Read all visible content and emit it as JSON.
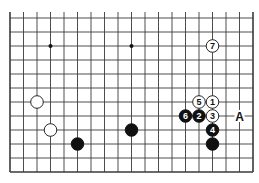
{
  "diagram": {
    "type": "go-board-fragment",
    "columns": 19,
    "rows": 12,
    "edges": {
      "left": true,
      "right": true,
      "bottom": true,
      "top": false
    },
    "colors": {
      "line": "#3a3a3a",
      "black_stone": "#111111",
      "white_stone": "#ffffff",
      "background": "#ffffff"
    },
    "star_points": [
      {
        "col": 3,
        "row": 2
      },
      {
        "col": 9,
        "row": 2
      }
    ],
    "stones": [
      {
        "color": "white",
        "col": 15,
        "row": 2,
        "label": "7"
      },
      {
        "color": "white",
        "col": 15,
        "row": 6,
        "label": "1"
      },
      {
        "color": "black",
        "col": 14,
        "row": 7,
        "label": "2"
      },
      {
        "color": "white",
        "col": 15,
        "row": 7,
        "label": "3"
      },
      {
        "color": "black",
        "col": 15,
        "row": 8,
        "label": "4"
      },
      {
        "color": "white",
        "col": 14,
        "row": 6,
        "label": "5"
      },
      {
        "color": "black",
        "col": 13,
        "row": 7,
        "label": "6"
      },
      {
        "color": "black",
        "col": 15,
        "row": 9,
        "label": ""
      },
      {
        "color": "white",
        "col": 2,
        "row": 6,
        "label": ""
      },
      {
        "color": "white",
        "col": 3,
        "row": 8,
        "label": ""
      },
      {
        "color": "black",
        "col": 5,
        "row": 9,
        "label": ""
      },
      {
        "color": "black",
        "col": 9,
        "row": 8,
        "label": ""
      }
    ],
    "marks": [
      {
        "col": 17,
        "row": 7,
        "label": "A"
      }
    ]
  }
}
